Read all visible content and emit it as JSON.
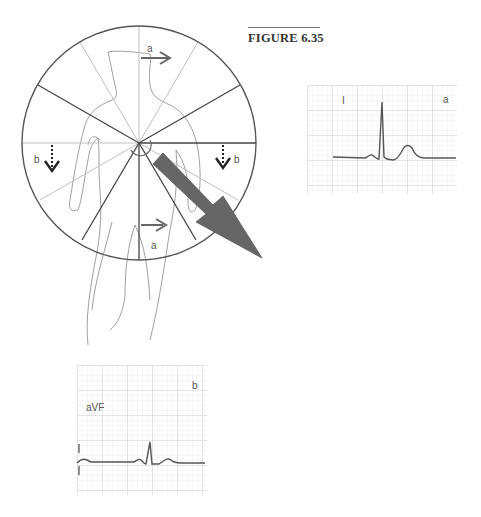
{
  "figure": {
    "title": "FIGURE 6.35"
  },
  "hexaxial_diagram": {
    "labels": {
      "top_arrow": "a",
      "bottom_arrow": "a",
      "left_arrow": "b",
      "right_arrow": "b"
    },
    "colors": {
      "circle": "#555555",
      "dark_spokes": "#444444",
      "light_spokes": "#bbbbbb",
      "arrows": "#666666",
      "big_vector": "#666666",
      "dotted_arrows": "#222222",
      "body_outline": "#888888"
    }
  },
  "ecg_strips": [
    {
      "id": "a",
      "lead": "I",
      "corner_label": "a"
    },
    {
      "id": "b",
      "lead": "aVF",
      "corner_label": "b"
    }
  ],
  "colors": {
    "grid_minor": "#e6e6e6",
    "grid_major": "#c8c8c8",
    "trace": "#555555"
  }
}
